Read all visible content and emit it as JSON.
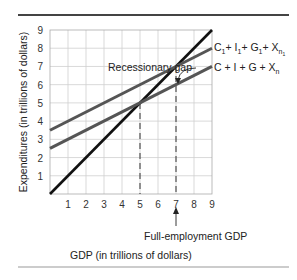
{
  "chart_data": {
    "type": "line",
    "title": "",
    "xlabel": "GDP (in trillions of dollars)",
    "ylabel": "Expenditures (in trillions of dollars)",
    "xlim": [
      0,
      9
    ],
    "ylim": [
      0,
      9
    ],
    "x_ticks": [
      "1",
      "2",
      "3",
      "4",
      "5",
      "6",
      "7",
      "8",
      "9"
    ],
    "y_ticks": [
      "1",
      "2",
      "3",
      "4",
      "5",
      "6",
      "7",
      "8",
      "9"
    ],
    "grid": true,
    "series": [
      {
        "name": "45-degree line",
        "x": [
          0,
          9
        ],
        "y": [
          0,
          9
        ],
        "color": "#111111"
      },
      {
        "name": "C1+ I1+ G1+ Xn1",
        "x": [
          0,
          9
        ],
        "y": [
          3.5,
          8.0
        ],
        "color": "#555555"
      },
      {
        "name": "C + I + G + Xn",
        "x": [
          0,
          9
        ],
        "y": [
          2.5,
          7.0
        ],
        "color": "#555555"
      }
    ],
    "annotations": [
      {
        "text": "Recessionary gap",
        "points_to": [
          7,
          6.5
        ]
      },
      {
        "text": "Full-employment GDP",
        "points_to_x": 7
      },
      {
        "type": "dashed-vertical",
        "x": 5,
        "y_top": 5
      },
      {
        "type": "dashed-vertical",
        "x": 7,
        "y_top": 7
      }
    ],
    "legend_position": "inline-right"
  },
  "labels": {
    "upper_line": {
      "main": "C",
      "s1": "1",
      "p1": "+ I",
      "s2": "1",
      "p2": "+ G",
      "s3": "1",
      "p3": "+ X",
      "s4": "n",
      "s5": "1"
    },
    "lower_line": {
      "p1": "C + I + G + X",
      "s1": "n"
    },
    "gap": "Recessionary gap",
    "full_employment": "Full-employment GDP",
    "xlabel": "GDP (in trillions of dollars)",
    "ylabel": "Expenditures (in trillions of dollars)"
  }
}
